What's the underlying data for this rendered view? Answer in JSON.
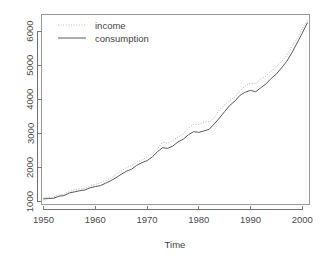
{
  "chart_data": {
    "type": "line",
    "title": "",
    "subtitle": "",
    "xlabel": "Time",
    "ylabel": "",
    "xlim": [
      1949.5,
      2001.5
    ],
    "ylim": [
      900,
      6500
    ],
    "xticks": [
      1950,
      1960,
      1970,
      1980,
      1990,
      2000
    ],
    "xtick_labels": [
      "1950",
      "1960",
      "1970",
      "1980",
      "1990",
      "2000"
    ],
    "yticks": [
      1000,
      2000,
      3000,
      4000,
      5000,
      6000
    ],
    "ytick_labels": [
      "1000",
      "2000",
      "3000",
      "4000",
      "5000",
      "6000"
    ],
    "grid": false,
    "legend_position": "top-left",
    "legend": [
      {
        "label": "income",
        "style": "dotted",
        "color": "#b4b4b4"
      },
      {
        "label": "consumption",
        "style": "solid",
        "color": "#5a5a5a"
      }
    ],
    "x": [
      1950,
      1951,
      1952,
      1953,
      1954,
      1955,
      1956,
      1957,
      1958,
      1959,
      1960,
      1961,
      1962,
      1963,
      1964,
      1965,
      1966,
      1967,
      1968,
      1969,
      1970,
      1971,
      1972,
      1973,
      1974,
      1975,
      1976,
      1977,
      1978,
      1979,
      1980,
      1981,
      1982,
      1983,
      1984,
      1985,
      1986,
      1987,
      1988,
      1989,
      1990,
      1991,
      1992,
      1993,
      1994,
      1995,
      1996,
      1997,
      1998,
      1999,
      2000,
      2001
    ],
    "series": [
      {
        "name": "income",
        "style": "dotted",
        "color": "#b4b4b4",
        "values": [
          1110,
          1120,
          1140,
          1200,
          1215,
          1300,
          1340,
          1375,
          1390,
          1460,
          1500,
          1555,
          1625,
          1690,
          1800,
          1900,
          1990,
          2060,
          2160,
          2220,
          2310,
          2410,
          2540,
          2740,
          2710,
          2790,
          2900,
          2980,
          3160,
          3260,
          3260,
          3330,
          3340,
          3450,
          3700,
          3840,
          3970,
          4070,
          4260,
          4390,
          4480,
          4460,
          4600,
          4680,
          4830,
          4960,
          5100,
          5290,
          5560,
          5780,
          6060,
          6320
        ]
      },
      {
        "name": "consumption",
        "style": "solid",
        "color": "#5a5a5a",
        "values": [
          1080,
          1090,
          1100,
          1160,
          1175,
          1255,
          1285,
          1320,
          1340,
          1405,
          1440,
          1470,
          1540,
          1615,
          1700,
          1800,
          1890,
          1950,
          2060,
          2140,
          2200,
          2310,
          2460,
          2580,
          2560,
          2630,
          2750,
          2830,
          2960,
          3050,
          3030,
          3070,
          3120,
          3280,
          3450,
          3640,
          3820,
          3950,
          4120,
          4210,
          4260,
          4220,
          4340,
          4450,
          4610,
          4740,
          4920,
          5110,
          5360,
          5650,
          5940,
          6240
        ]
      }
    ]
  },
  "plot_geometry": {
    "left": 41,
    "right": 310,
    "top": 14,
    "bottom": 205
  },
  "axis_titles": {
    "x": "Time"
  }
}
